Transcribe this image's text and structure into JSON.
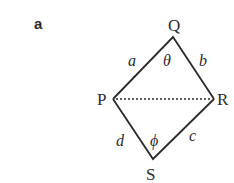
{
  "panel_label": "a",
  "vertices": {
    "P": {
      "label": "P",
      "x": 113,
      "y": 99
    },
    "Q": {
      "label": "Q",
      "x": 173,
      "y": 37
    },
    "R": {
      "label": "R",
      "x": 214,
      "y": 99
    },
    "S": {
      "label": "S",
      "x": 153,
      "y": 159
    }
  },
  "sides": {
    "a": "a",
    "b": "b",
    "c": "c",
    "d": "d"
  },
  "angles": {
    "theta": "θ",
    "phi": "ϕ"
  },
  "diagonal": {
    "from": "P",
    "to": "R",
    "style": "dotted"
  },
  "colors": {
    "stroke": "#2b2b2b",
    "background": "#ffffff"
  }
}
